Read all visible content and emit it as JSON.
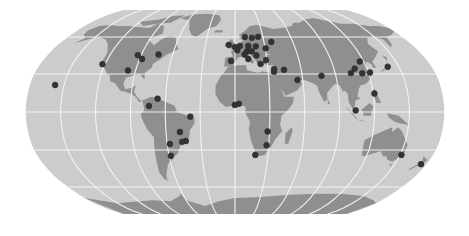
{
  "map": {
    "projection": "robinson",
    "colors": {
      "background": "#ffffff",
      "ocean": "#cccccc",
      "land": "#8f8f8f",
      "graticule": "#f2f2f2",
      "marker": "#333333"
    },
    "graticule": {
      "lon_step_deg": 30,
      "lat_step_deg": 30
    },
    "markers": [
      {
        "name": "Hawaii",
        "lon": -157.9,
        "lat": 21.3
      },
      {
        "name": "San Francisco",
        "lon": -122.4,
        "lat": 37.8
      },
      {
        "name": "Chicago",
        "lon": -87.6,
        "lat": 41.9
      },
      {
        "name": "Dallas",
        "lon": -96.8,
        "lat": 32.8
      },
      {
        "name": "Minneapolis",
        "lon": -93.3,
        "lat": 45.0
      },
      {
        "name": "Montreal",
        "lon": -73.6,
        "lat": 45.5
      },
      {
        "name": "Bogota",
        "lon": -74.1,
        "lat": 4.7
      },
      {
        "name": "Caracas",
        "lon": -66.9,
        "lat": 10.5
      },
      {
        "name": "Fortaleza",
        "lon": -38.5,
        "lat": -3.7
      },
      {
        "name": "Brasilia",
        "lon": -47.9,
        "lat": -15.8
      },
      {
        "name": "Rio de Janeiro",
        "lon": -43.2,
        "lat": -22.9
      },
      {
        "name": "Asuncion",
        "lon": -57.6,
        "lat": -25.3
      },
      {
        "name": "Sao Paulo",
        "lon": -46.6,
        "lat": -23.5
      },
      {
        "name": "Buenos Aires",
        "lon": -58.4,
        "lat": -34.6
      },
      {
        "name": "Dublin",
        "lon": -6.3,
        "lat": 53.3
      },
      {
        "name": "London",
        "lon": -0.1,
        "lat": 51.5
      },
      {
        "name": "Oslo",
        "lon": 10.7,
        "lat": 59.9
      },
      {
        "name": "Stockholm",
        "lon": 18.1,
        "lat": 59.3
      },
      {
        "name": "Helsinki",
        "lon": 24.9,
        "lat": 60.2
      },
      {
        "name": "Moscow",
        "lon": 37.6,
        "lat": 55.8
      },
      {
        "name": "Amsterdam",
        "lon": 4.9,
        "lat": 52.4
      },
      {
        "name": "Berlin",
        "lon": 13.4,
        "lat": 52.5
      },
      {
        "name": "Warsaw",
        "lon": 21.0,
        "lat": 52.2
      },
      {
        "name": "Paris",
        "lon": 2.3,
        "lat": 48.9
      },
      {
        "name": "Munich",
        "lon": 11.6,
        "lat": 48.1
      },
      {
        "name": "Vienna",
        "lon": 16.4,
        "lat": 48.2
      },
      {
        "name": "Kyiv",
        "lon": 30.5,
        "lat": 50.5
      },
      {
        "name": "Madrid",
        "lon": -3.7,
        "lat": 40.4
      },
      {
        "name": "Milan",
        "lon": 9.2,
        "lat": 45.5
      },
      {
        "name": "Rome",
        "lon": 12.5,
        "lat": 41.9
      },
      {
        "name": "Belgrade",
        "lon": 20.5,
        "lat": 44.8
      },
      {
        "name": "Athens",
        "lon": 23.7,
        "lat": 38.0
      },
      {
        "name": "Istanbul",
        "lon": 29.0,
        "lat": 41.0
      },
      {
        "name": "Beirut",
        "lon": 35.5,
        "lat": 33.9
      },
      {
        "name": "Jerusalem",
        "lon": 35.2,
        "lat": 31.8
      },
      {
        "name": "Baghdad",
        "lon": 44.4,
        "lat": 33.3
      },
      {
        "name": "Dubai",
        "lon": 55.3,
        "lat": 25.3
      },
      {
        "name": "Delhi",
        "lon": 77.2,
        "lat": 28.6
      },
      {
        "name": "Lagos",
        "lon": 3.4,
        "lat": 6.5
      },
      {
        "name": "Accra",
        "lon": -0.2,
        "lat": 5.6
      },
      {
        "name": "Lusaka",
        "lon": 28.3,
        "lat": -15.4
      },
      {
        "name": "Johannesburg",
        "lon": 28.0,
        "lat": -26.2
      },
      {
        "name": "Cape Town",
        "lon": 18.4,
        "lat": -33.9
      },
      {
        "name": "Beijing",
        "lon": 116.4,
        "lat": 39.9
      },
      {
        "name": "Chengdu",
        "lon": 104.1,
        "lat": 30.7
      },
      {
        "name": "Xi'an",
        "lon": 108.9,
        "lat": 34.3
      },
      {
        "name": "Shanghai",
        "lon": 121.5,
        "lat": 31.2
      },
      {
        "name": "Wuhan",
        "lon": 114.3,
        "lat": 30.6
      },
      {
        "name": "Tokyo",
        "lon": 139.7,
        "lat": 35.7
      },
      {
        "name": "Manila",
        "lon": 121.0,
        "lat": 14.6
      },
      {
        "name": "Singapore",
        "lon": 103.8,
        "lat": 1.3
      },
      {
        "name": "Sydney",
        "lon": 151.2,
        "lat": -33.9
      },
      {
        "name": "Wellington",
        "lon": 174.8,
        "lat": -41.3
      }
    ]
  }
}
